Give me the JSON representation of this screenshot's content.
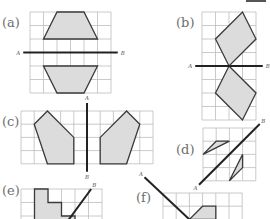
{
  "colors": {
    "grid": "#bdbdbd",
    "shape_fill": "#dcdcdc",
    "shape_stroke": "#3a3a3a",
    "mirror_line": "#222222",
    "label": "#6d6d6d",
    "axis_letter": "#555555"
  },
  "panels": [
    {
      "id": "a",
      "label": "(a)",
      "label_pos": [
        2,
        16
      ],
      "grid": {
        "x": 30,
        "y": 12,
        "cols": 6,
        "rows": 6,
        "cell": 13.5
      },
      "mirror": {
        "from": [
          -0.5,
          3
        ],
        "to": [
          6.5,
          3
        ],
        "start_label": "A",
        "end_label": "B"
      },
      "shapes": [
        [
          [
            2,
            0
          ],
          [
            4,
            0
          ],
          [
            5,
            2
          ],
          [
            1,
            2
          ]
        ],
        [
          [
            1,
            4
          ],
          [
            5,
            4
          ],
          [
            4,
            6
          ],
          [
            2,
            6
          ]
        ]
      ]
    },
    {
      "id": "b",
      "label": "(b)",
      "label_pos": [
        176,
        16
      ],
      "grid": {
        "x": 202,
        "y": 12,
        "cols": 4,
        "rows": 8,
        "cell": 13.5
      },
      "mirror": {
        "from": [
          -0.5,
          4
        ],
        "to": [
          4.5,
          4
        ],
        "start_label": "A",
        "end_label": "B"
      },
      "shapes": [
        [
          [
            3,
            0
          ],
          [
            4,
            2
          ],
          [
            2,
            4
          ],
          [
            1,
            2
          ]
        ],
        [
          [
            2,
            4
          ],
          [
            4,
            6
          ],
          [
            3,
            8
          ],
          [
            1,
            6
          ]
        ]
      ]
    },
    {
      "id": "c",
      "label": "(c)",
      "label_pos": [
        2,
        115
      ],
      "grid": {
        "x": 21,
        "y": 111,
        "cols": 10,
        "rows": 4,
        "cell": 13.2
      },
      "mirror": {
        "from": [
          5,
          -0.6
        ],
        "to": [
          5,
          4.6
        ],
        "start_label": "A",
        "end_label": "B"
      },
      "shapes": [
        [
          [
            2,
            0
          ],
          [
            1,
            1
          ],
          [
            2,
            4
          ],
          [
            4,
            4
          ],
          [
            4,
            2
          ]
        ],
        [
          [
            8,
            0
          ],
          [
            9,
            1
          ],
          [
            8,
            4
          ],
          [
            6,
            4
          ],
          [
            6,
            2
          ]
        ]
      ]
    },
    {
      "id": "d",
      "label": "(d)",
      "label_pos": [
        176,
        143
      ],
      "grid": {
        "x": 203,
        "y": 128,
        "cols": 4,
        "rows": 4,
        "cell": 13.2
      },
      "mirror": {
        "from": [
          -0.3,
          4.3
        ],
        "to": [
          4.3,
          -0.3
        ],
        "start_label": "A",
        "end_label": "B"
      },
      "shapes": [
        [
          [
            0,
            2
          ],
          [
            2,
            1
          ],
          [
            1,
            1
          ]
        ],
        [
          [
            2,
            4
          ],
          [
            3,
            2
          ],
          [
            3,
            3
          ]
        ]
      ]
    },
    {
      "id": "e",
      "label": "(e)",
      "label_pos": [
        2,
        184
      ],
      "grid": {
        "x": 21,
        "y": 189,
        "cols": 6,
        "rows": 3,
        "cell": 13.5
      },
      "mirror": {
        "from": [
          3,
          3
        ],
        "to": [
          5.2,
          0
        ],
        "start_label": "",
        "end_label": "B"
      },
      "shapes": [
        [
          [
            1,
            0
          ],
          [
            2,
            0
          ],
          [
            2,
            1
          ],
          [
            3,
            1
          ],
          [
            3,
            2
          ],
          [
            4,
            2
          ],
          [
            4,
            3
          ],
          [
            1,
            3
          ]
        ]
      ]
    },
    {
      "id": "f",
      "label": "(f)",
      "label_pos": [
        136,
        191
      ],
      "grid": {
        "x": 163,
        "y": 193,
        "cols": 6,
        "rows": 2,
        "cell": 13.2
      },
      "mirror": {
        "from": [
          -1.4,
          -1.2
        ],
        "to": [
          2,
          2
        ],
        "start_label": "A",
        "end_label": ""
      },
      "shapes": [
        [
          [
            2,
            2
          ],
          [
            3,
            1
          ],
          [
            4,
            1
          ],
          [
            4,
            2
          ]
        ]
      ]
    }
  ]
}
